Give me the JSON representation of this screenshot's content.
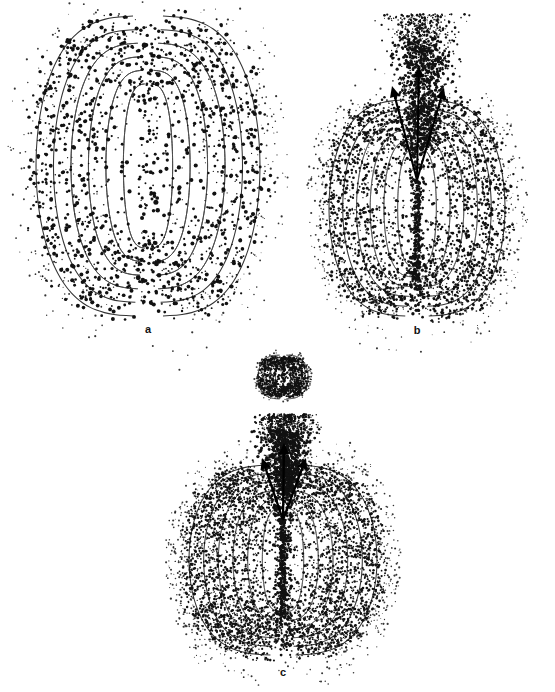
{
  "figure": {
    "title": "",
    "background_color": "#ffffff",
    "width": 555,
    "height": 692,
    "ink_color": "#111111",
    "contour_color": "#4a4a4a"
  },
  "panels": [
    {
      "id": "a",
      "label": "a",
      "label_x": 148,
      "label_y": 329,
      "center_x": 148,
      "center_y": 166,
      "lobe_half_width": 118,
      "lobe_half_height": 152,
      "contour_count": 6,
      "has_jet": false,
      "has_inset": false,
      "dot_count": 1500,
      "dot_style": "coarse-stipple",
      "description": "Dipole field contour lobes with coarse stippled point distribution; no jet."
    },
    {
      "id": "b",
      "label": "b",
      "label_x": 417,
      "label_y": 330,
      "center_x": 417,
      "center_y": 208,
      "lobe_half_width": 92,
      "lobe_half_height": 112,
      "contour_count": 6,
      "has_jet": true,
      "has_inset": false,
      "dot_count": 2600,
      "dot_style": "fine-stipple",
      "jet": {
        "origin_x": 417,
        "origin_y": 180,
        "plume_center_x": 423,
        "plume_top_y": 14,
        "plume_half_width": 46,
        "arrows": [
          {
            "name": "jet-arrow-left",
            "tip_x": 392,
            "tip_y": 86,
            "angle_deg": -18
          },
          {
            "name": "jet-arrow-center",
            "tip_x": 419,
            "tip_y": 68,
            "angle_deg": 0
          },
          {
            "name": "jet-arrow-right",
            "tip_x": 444,
            "tip_y": 88,
            "angle_deg": 16
          }
        ]
      },
      "description": "Dipole field contour lobes with an upward three-pronged jet feeding a dense dot plume."
    },
    {
      "id": "c",
      "label": "c",
      "label_x": 283,
      "label_y": 672,
      "center_x": 283,
      "center_y": 560,
      "lobe_half_width": 95,
      "lobe_half_height": 95,
      "contour_count": 6,
      "has_jet": true,
      "has_inset": true,
      "dot_count": 4200,
      "dot_style": "dense-stipple",
      "jet": {
        "origin_x": 283,
        "origin_y": 520,
        "plume_center_x": 286,
        "plume_top_y": 414,
        "plume_half_width": 38,
        "arrows": [
          {
            "name": "jet-arrow-left",
            "tip_x": 262,
            "tip_y": 458,
            "angle_deg": -22
          },
          {
            "name": "jet-arrow-center",
            "tip_x": 284,
            "tip_y": 443,
            "angle_deg": 0
          },
          {
            "name": "jet-arrow-right",
            "tip_x": 306,
            "tip_y": 458,
            "angle_deg": 20
          }
        ]
      },
      "inset": {
        "name": "compact-dipole-inset",
        "center_x": 283,
        "center_y": 377,
        "half_width": 26,
        "half_height": 24,
        "contour_count": 4,
        "dot_count": 900,
        "description": "Small compact high-density dipole inset above the main panel."
      },
      "description": "Largest dipole with dense stippling, upward jet plume and a compact dipole inset above."
    }
  ],
  "chart_data": {
    "type": "scatter",
    "title": "",
    "subtitle": "",
    "xlabel": "",
    "ylabel": "",
    "grid": false,
    "legend_position": "none",
    "annotations": [
      "a",
      "b",
      "c"
    ],
    "series": [
      {
        "name": "panel-a-points",
        "n_points": 1500,
        "marker": "dot",
        "color": "#111111"
      },
      {
        "name": "panel-b-points",
        "n_points": 2600,
        "marker": "dot",
        "color": "#111111"
      },
      {
        "name": "panel-c-points",
        "n_points": 4200,
        "marker": "dot",
        "color": "#111111"
      }
    ],
    "contour_levels_per_panel": [
      6,
      6,
      6
    ]
  }
}
